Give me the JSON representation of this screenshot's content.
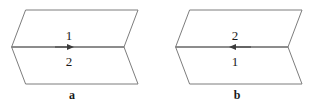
{
  "figure": {
    "background_color": "#ffffff",
    "stroke_color": "#7d7d7d",
    "text_color": "#1a1a1a",
    "arrow_color": "#3c3c3c",
    "width": 309,
    "height": 106,
    "panels": [
      {
        "id": "panel-a",
        "caption": "a",
        "caption_x": 72,
        "caption_y": 99,
        "arrow_direction": "right",
        "upper_region_label": "1",
        "lower_region_label": "2",
        "upper_label_x": 69,
        "upper_label_y": 40,
        "lower_label_x": 69,
        "lower_label_y": 66,
        "upper_polygon": "26,10 138,10 124,47 12,47",
        "lower_polygon": "12,47 124,47 138,84 26,84",
        "middle_edge": "12,47 124,47",
        "arrow_shaft": "55,47 72,47",
        "arrow_head": "74,47 67,44 67,50"
      },
      {
        "id": "panel-b",
        "caption": "b",
        "caption_x": 237,
        "caption_y": 99,
        "arrow_direction": "left",
        "upper_region_label": "2",
        "lower_region_label": "1",
        "upper_label_x": 235,
        "upper_label_y": 40,
        "lower_label_x": 235,
        "lower_label_y": 66,
        "upper_polygon": "190,10 302,10 288,47 176,47",
        "lower_polygon": "176,47 288,47 302,84 190,84",
        "middle_edge": "176,47 288,47",
        "arrow_shaft": "234,47 251,47",
        "arrow_head": "229,47 236,44 236,50"
      }
    ]
  }
}
